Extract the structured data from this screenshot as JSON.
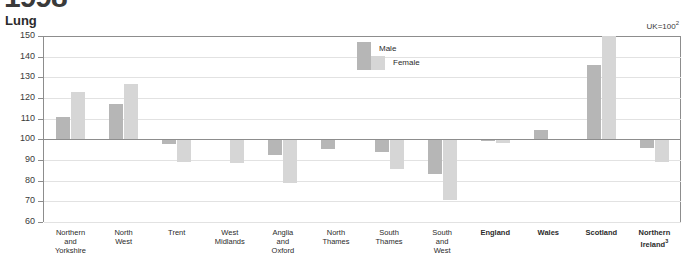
{
  "header": {
    "cropped_glyph": "1998"
  },
  "chart_data": {
    "type": "bar",
    "title": "Lung",
    "note": "UK=100",
    "note_superscript": "2",
    "xlabel": "",
    "ylabel": "",
    "ylim": [
      60,
      150
    ],
    "ytick_step": 10,
    "yticks": [
      60,
      70,
      80,
      90,
      100,
      110,
      120,
      130,
      140,
      150
    ],
    "baseline_value": 100,
    "grid": true,
    "legend_position": "inside-top-center",
    "categories": [
      "Northern and Yorkshire",
      "North West",
      "Trent",
      "West Midlands",
      "Anglia and Oxford",
      "North Thames",
      "South Thames",
      "South and West",
      "England",
      "Wales",
      "Scotland",
      "Northern Ireland"
    ],
    "category_lines": [
      [
        "Northern",
        "and",
        "Yorkshire"
      ],
      [
        "North",
        "West"
      ],
      [
        "Trent"
      ],
      [
        "West",
        "Midlands"
      ],
      [
        "Anglia",
        "and",
        "Oxford"
      ],
      [
        "North",
        "Thames"
      ],
      [
        "South",
        "Thames"
      ],
      [
        "South",
        "and",
        "West"
      ],
      [
        "England"
      ],
      [
        "Wales"
      ],
      [
        "Scotland"
      ],
      [
        "Northern",
        "Ireland"
      ]
    ],
    "category_bold": [
      false,
      false,
      false,
      false,
      false,
      false,
      false,
      false,
      true,
      true,
      true,
      true
    ],
    "category_superscripts": [
      "",
      "",
      "",
      "",
      "",
      "",
      "",
      "",
      "",
      "",
      "",
      "3"
    ],
    "series": [
      {
        "name": "Male",
        "color": "#b6b6b6",
        "values": [
          111,
          117,
          97.5,
          100,
          92.5,
          95.5,
          94,
          83,
          99,
          104.5,
          136,
          96
        ]
      },
      {
        "name": "Female",
        "color": "#d6d6d6",
        "values": [
          123,
          127,
          89,
          88.5,
          79,
          100,
          85.5,
          70.5,
          98,
          100,
          150,
          89
        ]
      }
    ]
  }
}
